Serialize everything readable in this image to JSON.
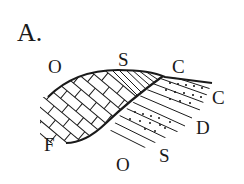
{
  "panel_label": "A.",
  "labels": {
    "top_left": "O",
    "top_mid": "S",
    "top_right": "C",
    "right_upper": "C",
    "right_lower": "D",
    "bottom_right": "S",
    "bottom_left": "O",
    "fault": "F"
  },
  "legend_patterns": [
    "brick (limestone)",
    "parallel lines (shale)",
    "dotted (sandstone)"
  ],
  "colors": {
    "ink": "#1a1a1a",
    "background": "#ffffff"
  }
}
